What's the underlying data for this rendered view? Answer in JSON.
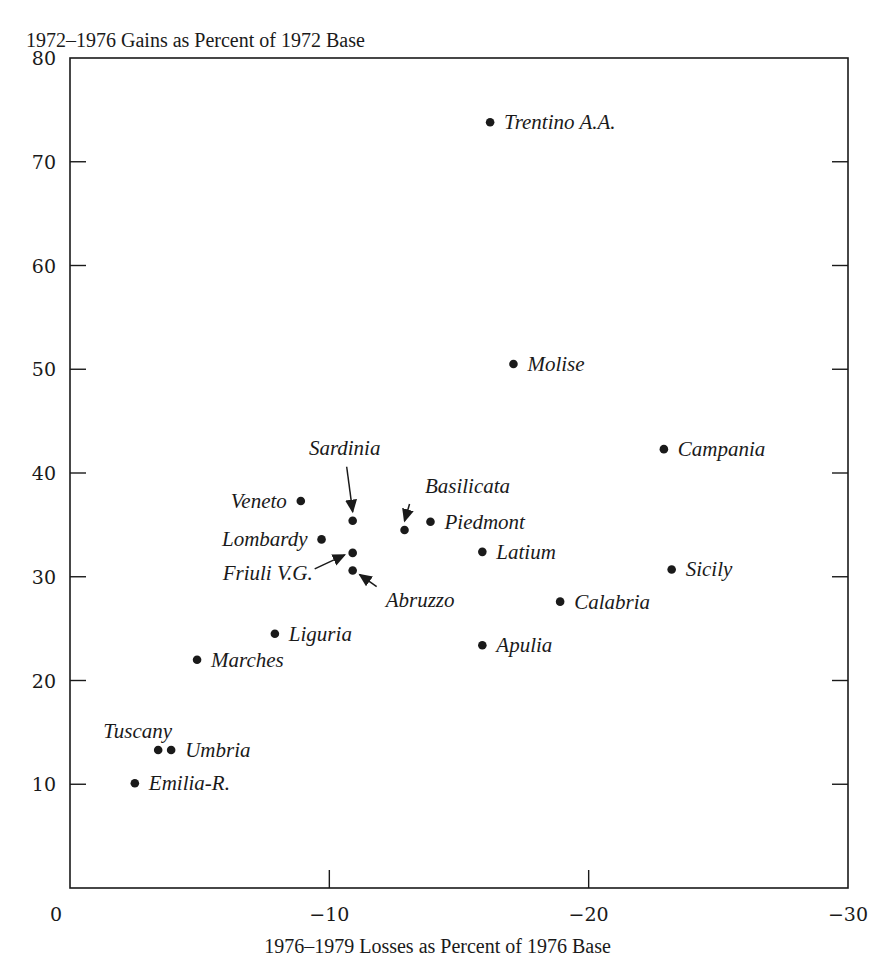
{
  "chart_data": {
    "type": "scatter",
    "title": "",
    "ylabel": "1972–1976 Gains as Percent of 1972 Base",
    "xlabel": "1976–1979 Losses as Percent of 1976 Base",
    "xlim": [
      0,
      -30
    ],
    "ylim": [
      0,
      80
    ],
    "x_ticks": [
      0,
      -10,
      -20,
      -30
    ],
    "x_tick_labels": [
      "0",
      "−10",
      "−20",
      "−30"
    ],
    "y_ticks": [
      10,
      20,
      30,
      40,
      50,
      60,
      70,
      80
    ],
    "y_tick_labels": [
      "10",
      "20",
      "30",
      "40",
      "50",
      "60",
      "70",
      "80"
    ],
    "grid": false,
    "legend": null,
    "series": [
      {
        "name": "Italian regions",
        "points": [
          {
            "label": "Trentino A.A.",
            "x": -16.2,
            "y": 73.8,
            "label_pos": "right"
          },
          {
            "label": "Molise",
            "x": -17.1,
            "y": 50.5,
            "label_pos": "right"
          },
          {
            "label": "Campania",
            "x": -22.9,
            "y": 42.3,
            "label_pos": "right"
          },
          {
            "label": "Veneto",
            "x": -8.9,
            "y": 37.3,
            "label_pos": "left"
          },
          {
            "label": "Sardinia",
            "x": -10.9,
            "y": 35.4,
            "label_pos": "above-arrow"
          },
          {
            "label": "Basilicata",
            "x": -12.9,
            "y": 34.5,
            "label_pos": "above-arrow"
          },
          {
            "label": "Piedmont",
            "x": -13.9,
            "y": 35.3,
            "label_pos": "right"
          },
          {
            "label": "Lombardy",
            "x": -9.7,
            "y": 33.6,
            "label_pos": "left"
          },
          {
            "label": "Friuli V.G.",
            "x": -10.9,
            "y": 32.3,
            "label_pos": "left-arrow"
          },
          {
            "label": "Latium",
            "x": -15.9,
            "y": 32.4,
            "label_pos": "right"
          },
          {
            "label": "Abruzzo",
            "x": -10.9,
            "y": 30.6,
            "label_pos": "below-right-arrow"
          },
          {
            "label": "Sicily",
            "x": -23.2,
            "y": 30.7,
            "label_pos": "right"
          },
          {
            "label": "Calabria",
            "x": -18.9,
            "y": 27.6,
            "label_pos": "right"
          },
          {
            "label": "Liguria",
            "x": -7.9,
            "y": 24.5,
            "label_pos": "right"
          },
          {
            "label": "Apulia",
            "x": -15.9,
            "y": 23.4,
            "label_pos": "right"
          },
          {
            "label": "Marches",
            "x": -4.9,
            "y": 22.0,
            "label_pos": "right"
          },
          {
            "label": "Tuscany",
            "x": -3.4,
            "y": 13.3,
            "label_pos": "above-left"
          },
          {
            "label": "Umbria",
            "x": -3.9,
            "y": 13.3,
            "label_pos": "right"
          },
          {
            "label": "Emilia-R.",
            "x": -2.5,
            "y": 10.1,
            "label_pos": "right"
          }
        ]
      }
    ]
  },
  "colors": {
    "ink": "#1a1a1a",
    "background": "#ffffff"
  }
}
